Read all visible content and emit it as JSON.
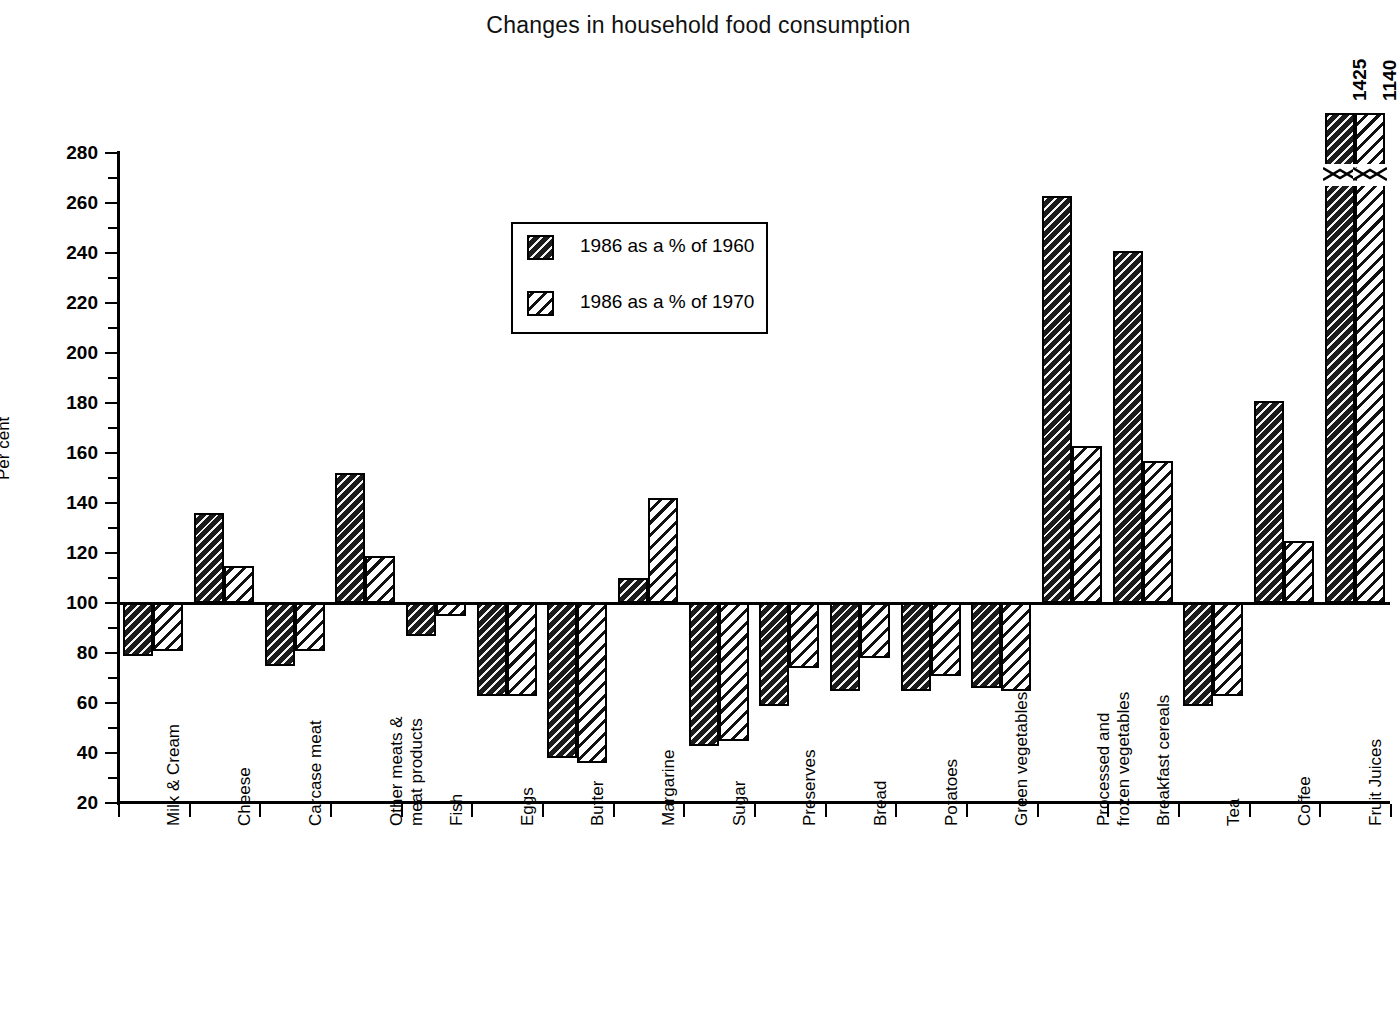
{
  "chart_data": {
    "type": "bar",
    "title": "Changes in household food consumption",
    "xlabel": "",
    "ylabel": "Per cent",
    "ylim": [
      20,
      280
    ],
    "ytick_step": 20,
    "yticks": [
      20,
      40,
      60,
      80,
      100,
      120,
      140,
      160,
      180,
      200,
      220,
      240,
      260,
      280
    ],
    "ytick_labels": [
      "20",
      "40",
      "60",
      "80",
      "100",
      "120",
      "140",
      "160",
      "180",
      "200",
      "220",
      "240",
      "260",
      "280"
    ],
    "grid": false,
    "baseline": 100,
    "legend_position": "upper-left-inside",
    "categories": [
      "Milk & Cream",
      "Cheese",
      "Carcase meat",
      "Other meats &\nmeat products",
      "Fish",
      "Eggs",
      "Butter",
      "Margarine",
      "Sugar",
      "Preserves",
      "Bread",
      "Potatoes",
      "Green vegetables",
      "Processed and\nfrozen vegetables",
      "Breakfast cereals",
      "Tea",
      "Coffee",
      "Fruit Juices"
    ],
    "series": [
      {
        "name": "1986 as a % of 1960",
        "style": "dark-hatched",
        "values": [
          79,
          136,
          75,
          152,
          87,
          63,
          38,
          110,
          43,
          59,
          65,
          65,
          66,
          263,
          241,
          59,
          181,
          1425
        ]
      },
      {
        "name": "1986 as a % of 1970",
        "style": "light-hatched",
        "values": [
          81,
          115,
          81,
          119,
          95,
          63,
          36,
          142,
          45,
          74,
          78,
          71,
          65,
          163,
          157,
          63,
          125,
          1140
        ]
      }
    ],
    "annotations": [
      {
        "label": "1425",
        "category": "Fruit Juices",
        "series": "1986 as a % of 1960",
        "note": "bar is broken/off-scale"
      },
      {
        "label": "1140",
        "category": "Fruit Juices",
        "series": "1986 as a % of 1970",
        "note": "bar is broken/off-scale"
      }
    ]
  },
  "legend": {
    "items": [
      {
        "label": "1986 as a % of 1960"
      },
      {
        "label": "1986 as a % of 1970"
      }
    ]
  },
  "colors": {
    "ink": "#000000",
    "paper": "#ffffff",
    "series_dark": "#1b1b1b",
    "series_light": "#ffffff"
  }
}
